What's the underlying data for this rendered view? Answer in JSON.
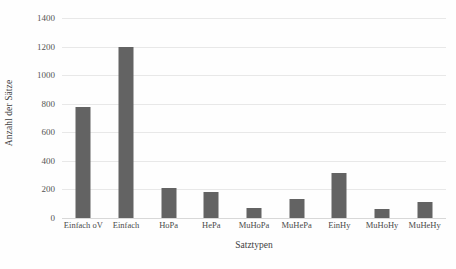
{
  "chart_data": {
    "type": "bar",
    "title": "",
    "subtitle": "",
    "xlabel": "Satztypen",
    "ylabel": "Anzahl der Sätze",
    "categories": [
      "Einfach oV",
      "Einfach",
      "HoPa",
      "HePa",
      "MuHoPa",
      "MuHePa",
      "EinHy",
      "MuHoHy",
      "MuHeHy"
    ],
    "values": [
      775,
      1200,
      208,
      185,
      72,
      130,
      315,
      60,
      110
    ],
    "ylim": [
      0,
      1400
    ],
    "ytick_values": [
      0,
      200,
      400,
      600,
      800,
      1000,
      1200,
      1400
    ],
    "ytick_labels": [
      "0",
      "200",
      "400",
      "600",
      "800",
      "1000",
      "1200",
      "1400"
    ],
    "grid": true,
    "grid_axis": "y",
    "legend": false,
    "legend_position": "none",
    "bar_color": "#636363",
    "gridline_color": "#e8e8e8",
    "background_color": "#fefefe",
    "axis_text_color": "#555555"
  }
}
